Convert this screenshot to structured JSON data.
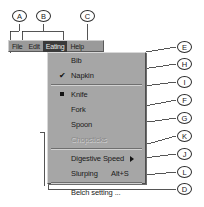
{
  "menubar": {
    "items": [
      {
        "id": "file",
        "label": "File",
        "mnemonic": "F",
        "selected": false
      },
      {
        "id": "edit",
        "label": "Edit",
        "mnemonic": "E",
        "selected": false
      },
      {
        "id": "eating",
        "label": "Eating",
        "mnemonic": "a",
        "selected": true
      },
      {
        "id": "help",
        "label": "Help",
        "mnemonic": "H",
        "selected": false
      }
    ]
  },
  "dropdown": {
    "title": "Eating",
    "items": [
      {
        "id": "bib",
        "label": "Bib",
        "marker": "none",
        "accel": "",
        "submenu": false,
        "disabled": false
      },
      {
        "id": "napkin",
        "label": "Napkin",
        "marker": "check",
        "accel": "",
        "submenu": false,
        "disabled": false
      },
      {
        "id": "sep1",
        "label": "",
        "marker": "separator",
        "accel": "",
        "submenu": false,
        "disabled": false
      },
      {
        "id": "knife",
        "label": "Knife",
        "marker": "radio",
        "accel": "",
        "submenu": false,
        "disabled": false
      },
      {
        "id": "fork",
        "label": "Fork",
        "marker": "none",
        "accel": "",
        "submenu": false,
        "disabled": false
      },
      {
        "id": "spoon",
        "label": "Spoon",
        "marker": "none",
        "accel": "",
        "submenu": false,
        "disabled": false
      },
      {
        "id": "chopsticks",
        "label": "Chopsticks",
        "marker": "none",
        "accel": "",
        "submenu": false,
        "disabled": true
      },
      {
        "id": "sep2",
        "label": "",
        "marker": "separator",
        "accel": "",
        "submenu": false,
        "disabled": false
      },
      {
        "id": "digestive",
        "label": "Digestive Speed",
        "marker": "none",
        "accel": "",
        "submenu": true,
        "disabled": false
      },
      {
        "id": "slurping",
        "label": "Slurping",
        "marker": "none",
        "accel": "Alt+S",
        "submenu": false,
        "disabled": false
      },
      {
        "id": "sep3",
        "label": "",
        "marker": "separator",
        "accel": "",
        "submenu": false,
        "disabled": false
      },
      {
        "id": "belch",
        "label": "Belch setting ...",
        "marker": "none",
        "accel": "",
        "submenu": false,
        "disabled": false
      }
    ],
    "check_glyph": "✔"
  },
  "callouts": [
    {
      "id": "A",
      "label": "A",
      "x": 19,
      "y": 16
    },
    {
      "id": "B",
      "label": "B",
      "x": 43,
      "y": 16
    },
    {
      "id": "C",
      "label": "C",
      "x": 87,
      "y": 16
    },
    {
      "id": "E",
      "label": "E",
      "x": 184,
      "y": 47
    },
    {
      "id": "H",
      "label": "H",
      "x": 184,
      "y": 64
    },
    {
      "id": "I",
      "label": "I",
      "x": 184,
      "y": 82
    },
    {
      "id": "F",
      "label": "F",
      "x": 184,
      "y": 100
    },
    {
      "id": "G",
      "label": "G",
      "x": 184,
      "y": 118
    },
    {
      "id": "K",
      "label": "K",
      "x": 184,
      "y": 136
    },
    {
      "id": "J",
      "label": "J",
      "x": 184,
      "y": 154
    },
    {
      "id": "L",
      "label": "L",
      "x": 184,
      "y": 172
    },
    {
      "id": "D",
      "label": "D",
      "x": 184,
      "y": 189
    }
  ],
  "caption": {
    "text": ""
  },
  "colors": {
    "menubar_face": "#9a9a9a",
    "menu_face": "#a6a6a6",
    "selection": "#3a3a3a",
    "text": "#1a1a1a",
    "disabled_text": "#8a8a8a",
    "leader_line": "#2b2b2b",
    "page_background": "#ffffff"
  }
}
